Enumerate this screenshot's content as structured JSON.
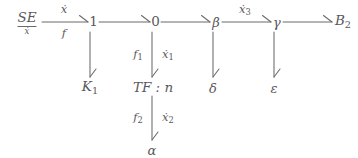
{
  "diagram": {
    "type": "bond-graph",
    "background_color": "#ffffff",
    "stroke_color": "#6a6a6d",
    "text_color": "#59595c",
    "nodes": {
      "source_effort": {
        "label": "SE",
        "subscript": "ẋ"
      },
      "junction_one": {
        "label": "1"
      },
      "junction_zero": {
        "label": "0"
      },
      "beta": {
        "label": "β"
      },
      "gamma": {
        "label": "γ"
      },
      "b2": {
        "label": "B",
        "subscript": "2"
      },
      "k1": {
        "label": "K",
        "subscript": "1"
      },
      "transformer": {
        "label": "TF : n"
      },
      "delta": {
        "label": "δ"
      },
      "epsilon": {
        "label": "ε"
      },
      "alpha": {
        "label": "α"
      }
    },
    "bond_labels": {
      "se_to_one_top": "ẋ",
      "se_to_one_bottom": "f",
      "beta_to_gamma": "ẋ",
      "beta_to_gamma_sub": "3",
      "zero_to_tf_left": "f",
      "zero_to_tf_left_sub": "1",
      "zero_to_tf_right": "ẋ",
      "zero_to_tf_right_sub": "1",
      "tf_to_alpha_left": "f",
      "tf_to_alpha_left_sub": "2",
      "tf_to_alpha_right": "ẋ",
      "tf_to_alpha_right_sub": "2"
    }
  }
}
